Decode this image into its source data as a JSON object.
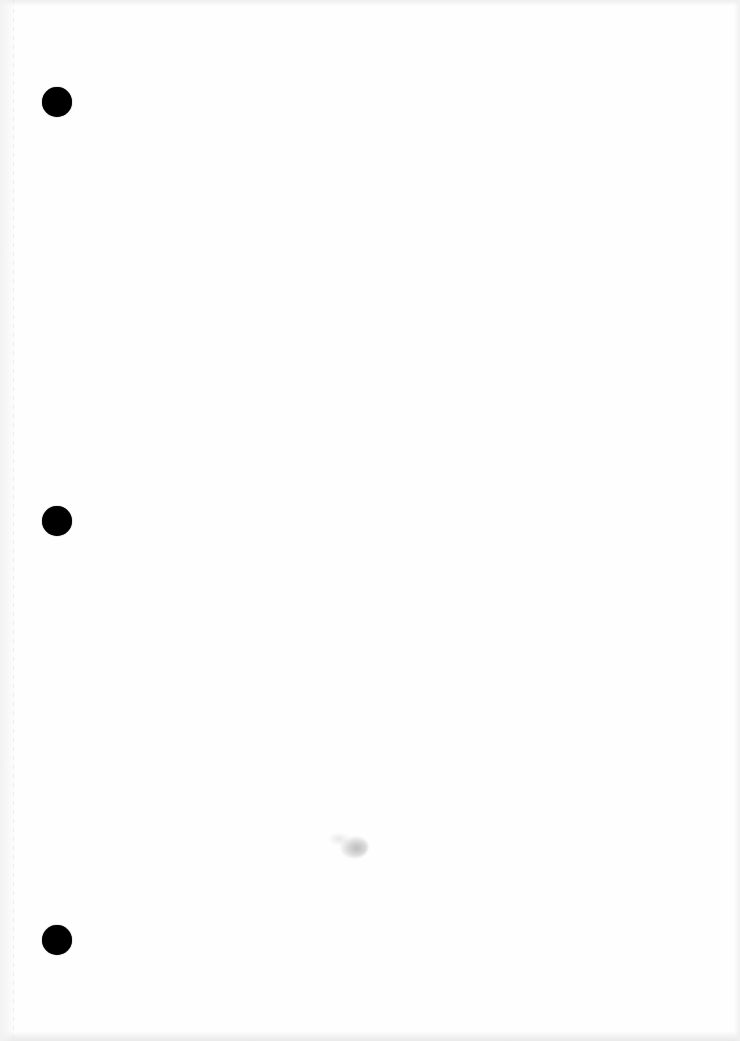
{
  "document": {
    "type": "blank-scanned-page",
    "background_color": "#ffffff",
    "punch_holes": [
      {
        "cx": 57,
        "cy": 102,
        "diameter": 30,
        "color": "#000000"
      },
      {
        "cx": 57,
        "cy": 521,
        "diameter": 30,
        "color": "#000000"
      },
      {
        "cx": 57,
        "cy": 940,
        "diameter": 30,
        "color": "#000000"
      }
    ],
    "marks": [
      {
        "kind": "smudge",
        "cx": 353,
        "cy": 848,
        "color": "#bdbdbd"
      }
    ]
  }
}
